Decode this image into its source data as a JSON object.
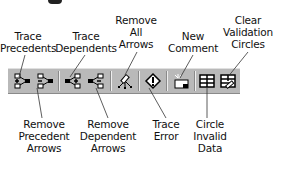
{
  "title_fragment": "",
  "toolbar": {
    "background": "#b9b9b9",
    "buttons": [
      {
        "id": "trace-precedents",
        "label_lines": [
          "Trace",
          "Precedents"
        ],
        "position": "top"
      },
      {
        "id": "remove-precedent-arrows",
        "label_lines": [
          "Remove",
          "Precedent",
          "Arrows"
        ],
        "position": "bottom"
      },
      {
        "id": "trace-dependents",
        "label_lines": [
          "Trace",
          "Dependents"
        ],
        "position": "top"
      },
      {
        "id": "remove-dependent-arrows",
        "label_lines": [
          "Remove",
          "Dependent",
          "Arrows"
        ],
        "position": "bottom"
      },
      {
        "id": "remove-all-arrows",
        "label_lines": [
          "Remove",
          "All",
          "Arrows"
        ],
        "position": "top"
      },
      {
        "id": "trace-error",
        "label_lines": [
          "Trace",
          "Error"
        ],
        "position": "bottom"
      },
      {
        "id": "new-comment",
        "label_lines": [
          "New",
          "Comment"
        ],
        "position": "top"
      },
      {
        "id": "circle-invalid-data",
        "label_lines": [
          "Circle",
          "Invalid",
          "Data"
        ],
        "position": "bottom"
      },
      {
        "id": "clear-validation-circles",
        "label_lines": [
          "Clear",
          "Validation",
          "Circles"
        ],
        "position": "top"
      }
    ]
  }
}
